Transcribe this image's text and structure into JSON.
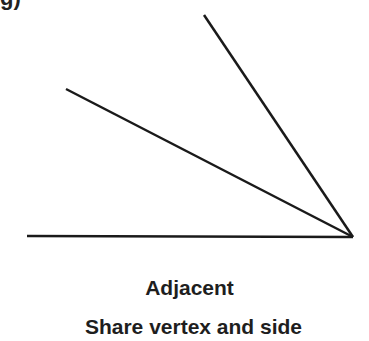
{
  "diagram": {
    "caption_cut_off": "g)",
    "title": "Adjacent",
    "subtitle": "Share vertex and side",
    "line_color": "#1a1a1a",
    "vertex": {
      "x": 353,
      "y": 237
    },
    "rays": [
      {
        "name": "horizontal-ray",
        "x1": 27,
        "y1": 236
      },
      {
        "name": "middle-ray",
        "x1": 66,
        "y1": 89
      },
      {
        "name": "upper-ray",
        "x1": 204,
        "y1": 15
      }
    ]
  }
}
